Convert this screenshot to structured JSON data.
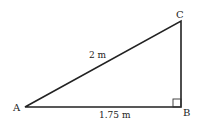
{
  "diagram": {
    "type": "right-triangle",
    "vertices": {
      "A": {
        "label": "A",
        "x": 25,
        "y": 107
      },
      "B": {
        "label": "B",
        "x": 181,
        "y": 107
      },
      "C": {
        "label": "C",
        "x": 181,
        "y": 21
      }
    },
    "sides": {
      "hypotenuse_AC": {
        "label": "2 m"
      },
      "base_AB": {
        "label": "1.75 m"
      }
    },
    "right_angle_at": "B",
    "colors": {
      "stroke": "#222222",
      "background": "#ffffff"
    }
  }
}
